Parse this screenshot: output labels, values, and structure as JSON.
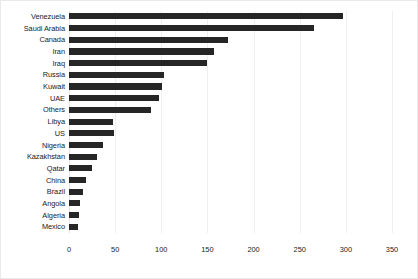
{
  "chart_data": {
    "type": "bar",
    "orientation": "horizontal",
    "title": "",
    "subtitle": "",
    "xlabel": "",
    "ylabel": "",
    "xlim": [
      0,
      350
    ],
    "xticks": [
      0,
      50,
      100,
      150,
      200,
      250,
      300,
      350
    ],
    "grid": "vertical",
    "legend": "none",
    "bar_color": "#262626",
    "gridline_color": "#efefef",
    "background_color": "#ffffff",
    "categories": [
      "Venezuela",
      "Saudi Arabia",
      "Canada",
      "Iran",
      "Iraq",
      "Russia",
      "Kuwait",
      "UAE",
      "Others",
      "Libya",
      "US",
      "Nigeria",
      "Kazakhstan",
      "Qatar",
      "China",
      "Brazil",
      "Angola",
      "Algeria",
      "Mexico"
    ],
    "values": [
      297,
      266,
      172,
      157,
      149,
      103,
      101,
      98,
      89,
      48,
      49,
      37,
      30,
      25,
      18,
      15,
      12,
      11,
      10
    ]
  }
}
